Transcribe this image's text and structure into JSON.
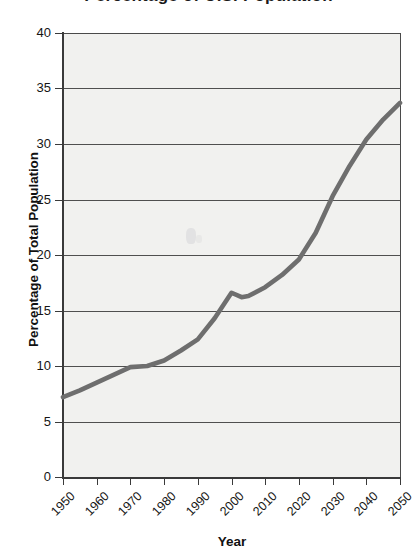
{
  "figure": {
    "title_sliver": "Percentage of U.S. Population",
    "background_color": "#ffffff",
    "plot_background_color": "#f1f1ef",
    "line_color": "#6e6e6e",
    "axis_color": "#3a3a3a"
  },
  "chart_data": {
    "type": "line",
    "title": "",
    "xlabel": "Year",
    "ylabel": "Percentage of Total Population",
    "xlim": [
      1950,
      2050
    ],
    "ylim": [
      0,
      40
    ],
    "grid": true,
    "legend": "none",
    "x_tick_labels": [
      "1950",
      "1960",
      "1970",
      "1980",
      "1990",
      "2000",
      "2010",
      "2020",
      "2030",
      "2040",
      "2050"
    ],
    "y_tick_labels": [
      "0",
      "5",
      "10",
      "15",
      "20",
      "25",
      "30",
      "35",
      "40"
    ],
    "x": [
      1950,
      1955,
      1960,
      1965,
      1970,
      1975,
      1980,
      1985,
      1990,
      1995,
      2000,
      2003,
      2005,
      2010,
      2015,
      2020,
      2025,
      2030,
      2035,
      2040,
      2045,
      2050
    ],
    "values": [
      7.2,
      7.8,
      8.5,
      9.2,
      9.9,
      10.0,
      10.5,
      11.4,
      12.4,
      14.3,
      16.6,
      16.2,
      16.3,
      17.1,
      18.2,
      19.6,
      22.0,
      25.3,
      28.0,
      30.4,
      32.2,
      33.7
    ],
    "series": [
      {
        "name": "Percentage of Total Population",
        "values": [
          7.2,
          7.8,
          8.5,
          9.2,
          9.9,
          10.0,
          10.5,
          11.4,
          12.4,
          14.3,
          16.6,
          16.2,
          16.3,
          17.1,
          18.2,
          19.6,
          22.0,
          25.3,
          28.0,
          30.4,
          32.2,
          33.7
        ]
      }
    ],
    "annotations": []
  }
}
